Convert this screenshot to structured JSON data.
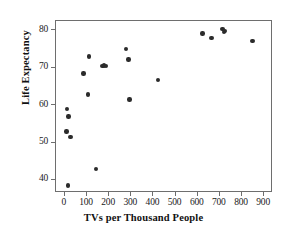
{
  "chart_data": {
    "type": "scatter",
    "title": "",
    "xlabel": "TVs per Thousand People",
    "ylabel": "Life Expectancy",
    "xlim": [
      -40,
      940
    ],
    "ylim": [
      36.5,
      82.5
    ],
    "xticks": [
      0,
      100,
      200,
      300,
      400,
      500,
      600,
      700,
      800,
      900
    ],
    "yticks": [
      40,
      50,
      60,
      70,
      80
    ],
    "xtick_labels": [
      "0",
      "100",
      "200",
      "300",
      "400",
      "500",
      "600",
      "700",
      "800",
      "900"
    ],
    "ytick_labels": [
      "40",
      "50",
      "60",
      "70",
      "80"
    ],
    "grid": false,
    "legend": null,
    "marker": {
      "shape": "circle",
      "color": "#2b2b2b",
      "size": 4.4
    },
    "frame": {
      "visible": true,
      "color": "#6e6e6e"
    },
    "points": [
      {
        "x": 13,
        "y": 38.5
      },
      {
        "x": 8,
        "y": 53.0
      },
      {
        "x": 10,
        "y": 59.0
      },
      {
        "x": 17,
        "y": 57.0
      },
      {
        "x": 25,
        "y": 51.5
      },
      {
        "x": 85,
        "y": 68.5
      },
      {
        "x": 105,
        "y": 62.8
      },
      {
        "x": 108,
        "y": 73.0
      },
      {
        "x": 140,
        "y": 43.0
      },
      {
        "x": 170,
        "y": 70.5
      },
      {
        "x": 178,
        "y": 70.6
      },
      {
        "x": 185,
        "y": 70.5
      },
      {
        "x": 275,
        "y": 75.0
      },
      {
        "x": 288,
        "y": 72.2
      },
      {
        "x": 292,
        "y": 61.5
      },
      {
        "x": 420,
        "y": 66.8
      },
      {
        "x": 622,
        "y": 79.2
      },
      {
        "x": 662,
        "y": 78.0
      },
      {
        "x": 712,
        "y": 80.4
      },
      {
        "x": 718,
        "y": 79.6
      },
      {
        "x": 722,
        "y": 79.9
      },
      {
        "x": 848,
        "y": 77.2
      }
    ]
  }
}
